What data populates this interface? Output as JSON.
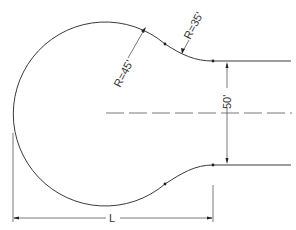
{
  "diagram": {
    "labels": {
      "large_radius": "R=45'",
      "small_radius": "R=35'",
      "width": "50'",
      "length": "L"
    },
    "colors": {
      "line": "#3a3a3a",
      "dimension": "#555555",
      "background": "#ffffff"
    }
  }
}
